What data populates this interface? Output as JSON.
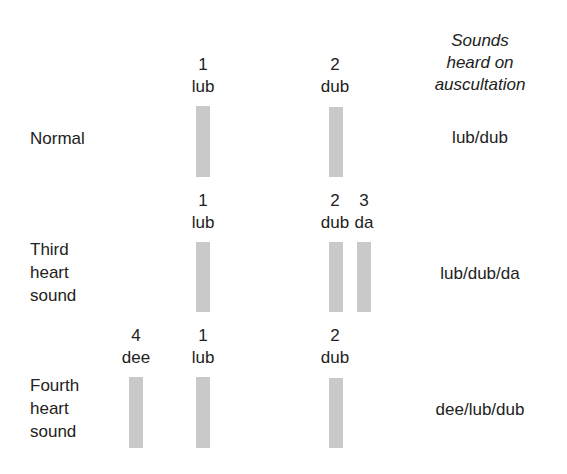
{
  "header": {
    "line1": "Sounds",
    "line2": "heard on",
    "line3": "auscultation"
  },
  "rows": [
    {
      "label_lines": [
        "Normal"
      ],
      "result": "lub/dub",
      "sounds": [
        {
          "num": "1",
          "name": "lub"
        },
        {
          "num": "2",
          "name": "dub"
        }
      ]
    },
    {
      "label_lines": [
        "Third",
        "heart",
        "sound"
      ],
      "result": "lub/dub/da",
      "sounds": [
        {
          "num": "1",
          "name": "lub"
        },
        {
          "num": "2",
          "name": "dub"
        },
        {
          "num": "3",
          "name": "da"
        }
      ]
    },
    {
      "label_lines": [
        "Fourth",
        "heart",
        "sound"
      ],
      "result": "dee/lub/dub",
      "sounds": [
        {
          "num": "4",
          "name": "dee"
        },
        {
          "num": "1",
          "name": "lub"
        },
        {
          "num": "2",
          "name": "dub"
        }
      ]
    }
  ],
  "colors": {
    "bar": "#c9c9c9",
    "text": "#222222"
  }
}
